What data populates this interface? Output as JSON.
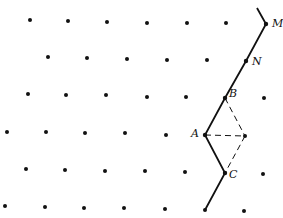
{
  "diagram": {
    "colors": {
      "ink": "#111111",
      "background": "#ffffff"
    },
    "lattice_points": [
      [
        30,
        20
      ],
      [
        68,
        21
      ],
      [
        107,
        22
      ],
      [
        147,
        23
      ],
      [
        187,
        23
      ],
      [
        226,
        23
      ],
      [
        48,
        57
      ],
      [
        87,
        58
      ],
      [
        127,
        59
      ],
      [
        167,
        60
      ],
      [
        207,
        60
      ],
      [
        28,
        94
      ],
      [
        66,
        95
      ],
      [
        106,
        95
      ],
      [
        147,
        97
      ],
      [
        186,
        97
      ],
      [
        264,
        98
      ],
      [
        7,
        132
      ],
      [
        46,
        132
      ],
      [
        85,
        133
      ],
      [
        125,
        133
      ],
      [
        166,
        135
      ],
      [
        245,
        136
      ],
      [
        26,
        169
      ],
      [
        65,
        170
      ],
      [
        105,
        171
      ],
      [
        145,
        171
      ],
      [
        185,
        172
      ],
      [
        263,
        174
      ],
      [
        5,
        206
      ],
      [
        45,
        207
      ],
      [
        84,
        208
      ],
      [
        124,
        208
      ],
      [
        165,
        209
      ],
      [
        205,
        210
      ],
      [
        244,
        211
      ]
    ],
    "labeled_points": [
      {
        "name": "M",
        "x": 266,
        "y": 24,
        "label_dx": 6,
        "label_dy": -6
      },
      {
        "name": "N",
        "x": 246,
        "y": 61,
        "label_dx": 6,
        "label_dy": -5
      },
      {
        "name": "B",
        "x": 225,
        "y": 98,
        "label_dx": 4,
        "label_dy": -10
      },
      {
        "name": "A",
        "x": 205,
        "y": 135,
        "label_dx": -14,
        "label_dy": -7
      },
      {
        "name": "C",
        "x": 225,
        "y": 173,
        "label_dx": 4,
        "label_dy": -4
      }
    ],
    "solid_path": [
      [
        257,
        8
      ],
      [
        266,
        24
      ],
      [
        246,
        61
      ],
      [
        225,
        98
      ],
      [
        205,
        135
      ],
      [
        225,
        173
      ],
      [
        205,
        210
      ]
    ],
    "dashed_segments": [
      [
        [
          225,
          98
        ],
        [
          245,
          136
        ]
      ],
      [
        [
          205,
          135
        ],
        [
          245,
          136
        ]
      ],
      [
        [
          245,
          136
        ],
        [
          225,
          173
        ]
      ]
    ]
  }
}
